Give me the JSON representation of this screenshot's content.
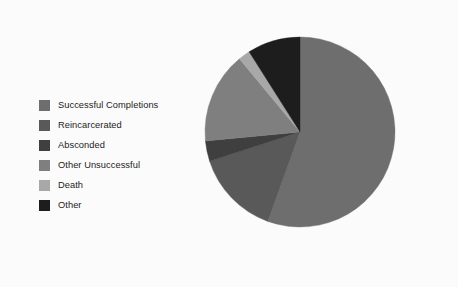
{
  "figure": {
    "background_color": "#fbfbfb",
    "type": "pie-chart-figure"
  },
  "legend": {
    "name": "pie-chart-legend",
    "items": [
      {
        "label": "Successful Completions",
        "color": "#6e6e6e",
        "swatch_name": "legend-swatch-successful-completions"
      },
      {
        "label": "Reincarcerated",
        "color": "#595959",
        "swatch_name": "legend-swatch-reincarcerated"
      },
      {
        "label": "Absconded",
        "color": "#3f3f3f",
        "swatch_name": "legend-swatch-absconded"
      },
      {
        "label": "Other Unsuccessful",
        "color": "#7f7f7f",
        "swatch_name": "legend-swatch-other-unsuccessful"
      },
      {
        "label": "Death",
        "color": "#a8a8a8",
        "swatch_name": "legend-swatch-death"
      },
      {
        "label": "Other",
        "color": "#1d1d1d",
        "swatch_name": "legend-swatch-other"
      }
    ]
  },
  "chart_data": {
    "type": "pie",
    "title": "",
    "subtitle": "",
    "xlabel": "",
    "ylabel": "",
    "grid": false,
    "legend_position": "left",
    "start_angle_deg": 0,
    "direction": "clockwise",
    "center_px": [
      300,
      132
    ],
    "radius_px": 95,
    "categories": [
      "Successful Completions",
      "Reincarcerated",
      "Absconded",
      "Other Unsuccessful",
      "Death",
      "Other"
    ],
    "values": [
      55.5,
      14.5,
      3.5,
      15.5,
      2.0,
      9.0
    ],
    "units": "percent",
    "colors": [
      "#6e6e6e",
      "#595959",
      "#3f3f3f",
      "#7f7f7f",
      "#a8a8a8",
      "#1d1d1d"
    ],
    "slice_angles_deg": [
      {
        "category": "Successful Completions",
        "start": 0,
        "end": 199.8
      },
      {
        "category": "Reincarcerated",
        "start": 199.8,
        "end": 252.0
      },
      {
        "category": "Absconded",
        "start": 252.0,
        "end": 264.6
      },
      {
        "category": "Other Unsuccessful",
        "start": 264.6,
        "end": 320.4
      },
      {
        "category": "Death",
        "start": 320.4,
        "end": 327.6
      },
      {
        "category": "Other",
        "start": 327.6,
        "end": 360.0
      }
    ],
    "data_labels_shown": false
  }
}
